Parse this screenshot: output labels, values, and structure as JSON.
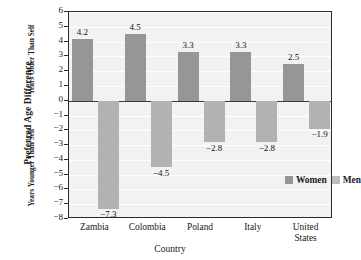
{
  "chart_data": {
    "type": "bar",
    "title": "",
    "xlabel": "Country",
    "ylabel": "Preferred Age Difference",
    "ylabel_upper": "Years Older Than Self",
    "ylabel_lower": "Years Younger Than Self",
    "categories": [
      "Zambia",
      "Colombia",
      "Poland",
      "Italy",
      "United States"
    ],
    "category_lines": [
      [
        "Zambia"
      ],
      [
        "Colombia"
      ],
      [
        "Poland"
      ],
      [
        "Italy"
      ],
      [
        "United",
        "States"
      ]
    ],
    "series": [
      {
        "name": "Women",
        "color": "#969696",
        "values": [
          4.2,
          4.5,
          3.3,
          3.3,
          2.5
        ],
        "labels": [
          "4.2",
          "4.5",
          "3.3",
          "3.3",
          "2.5"
        ]
      },
      {
        "name": "Men",
        "color": "#b2b2b2",
        "values": [
          -7.3,
          -4.5,
          -2.8,
          -2.8,
          -1.9
        ],
        "labels": [
          "−7.3",
          "−4.5",
          "−2.8",
          "−2.8",
          "−1.9"
        ]
      }
    ],
    "ylim": [
      -8,
      6
    ],
    "yticks": [
      6,
      5,
      4,
      3,
      2,
      1,
      0,
      -1,
      -2,
      -3,
      -4,
      -5,
      -6,
      -7,
      -8
    ],
    "ytick_labels": [
      "6",
      "5",
      "4",
      "3",
      "2",
      "1",
      "0",
      "−1",
      "−2",
      "−3",
      "−4",
      "−5",
      "−6",
      "−7",
      "−8"
    ],
    "grid": true,
    "legend_position": "inside-bottom-right",
    "plot_background": "#f2f2f2",
    "axis_color": "#2b2b2b"
  },
  "legend": {
    "items": [
      {
        "label": "Women",
        "color": "#969696"
      },
      {
        "label": "Men",
        "color": "#bdbdbd"
      }
    ]
  }
}
